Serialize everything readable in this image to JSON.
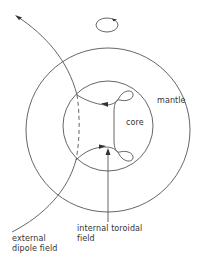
{
  "diagram": {
    "labels": {
      "mantle": "mantle",
      "core": "core",
      "internal_line1": "internal toroidal",
      "internal_line2": "field",
      "external_line1": "external",
      "external_line2": "dipole field"
    },
    "colors": {
      "line": "#555555",
      "text": "#333333",
      "background": "#ffffff"
    },
    "shapes": {
      "mantle_circle": {
        "cx": 108,
        "cy": 130,
        "r": 82
      },
      "core_circle": {
        "cx": 108,
        "cy": 126,
        "r": 45
      },
      "rotation_ellipse": {
        "cx": 107,
        "cy": 25,
        "rx": 11,
        "ry": 7
      }
    }
  }
}
